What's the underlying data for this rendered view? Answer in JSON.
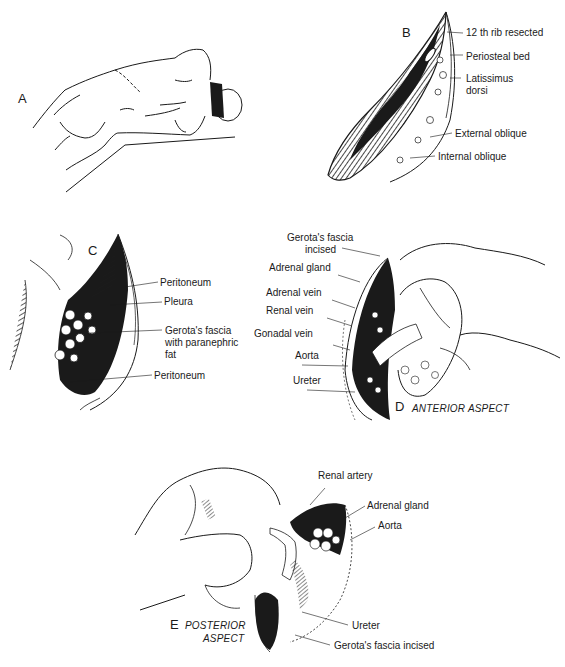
{
  "figure": {
    "panels": [
      {
        "id": "A",
        "letter": "A",
        "labels": []
      },
      {
        "id": "B",
        "letter": "B",
        "labels": [
          "12 th rib resected",
          "Periosteal bed",
          "Latissimus dorsi",
          "External oblique",
          "Internal oblique"
        ]
      },
      {
        "id": "C",
        "letter": "C",
        "labels": [
          "Peritoneum",
          "Pleura",
          "Gerota's fascia with paranephric fat",
          "Peritoneum"
        ]
      },
      {
        "id": "D",
        "letter": "D",
        "aspect": "ANTERIOR ASPECT",
        "labels": [
          "Gerota's fascia incised",
          "Adrenal gland",
          "Adrenal vein",
          "Renal vein",
          "Gonadal vein",
          "Aorta",
          "Ureter"
        ]
      },
      {
        "id": "E",
        "letter": "E",
        "aspect": "POSTERIOR ASPECT",
        "labels": [
          "Renal artery",
          "Adrenal gland",
          "Aorta",
          "Ureter",
          "Gerota's fascia incised"
        ]
      }
    ],
    "b_labels": {
      "rib": "12 th rib resected",
      "periosteal": "Periosteal bed",
      "latissimus_1": "Latissimus",
      "latissimus_2": "dorsi",
      "ext_oblique": "External oblique",
      "int_oblique": "Internal oblique"
    },
    "c_labels": {
      "peritoneum_top": "Peritoneum",
      "pleura": "Pleura",
      "gerota_1": "Gerota's fascia",
      "gerota_2": "with paranephric",
      "gerota_3": "fat",
      "peritoneum_bottom": "Peritoneum"
    },
    "d_labels": {
      "gerota_1": "Gerota's fascia",
      "gerota_2": "incised",
      "adrenal_gland": "Adrenal gland",
      "adrenal_vein": "Adrenal vein",
      "renal_vein": "Renal vein",
      "gonadal_vein": "Gonadal vein",
      "aorta": "Aorta",
      "ureter": "Ureter",
      "aspect": "ANTERIOR ASPECT"
    },
    "e_labels": {
      "renal_artery": "Renal artery",
      "adrenal_gland": "Adrenal gland",
      "aorta": "Aorta",
      "ureter": "Ureter",
      "gerota": "Gerota's fascia incised",
      "aspect_1": "POSTERIOR",
      "aspect_2": "ASPECT"
    },
    "colors": {
      "ink": "#1a1a1a",
      "background": "#ffffff"
    }
  }
}
